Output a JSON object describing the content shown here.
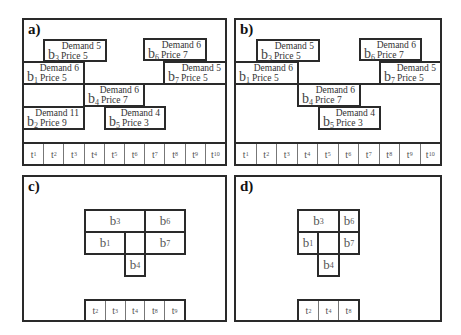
{
  "panels": {
    "a": {
      "label": "a)",
      "blocks": [
        {
          "id": "b3",
          "name": "b",
          "sub": "3",
          "demand": "Demand 5",
          "price": "Price 5"
        },
        {
          "id": "b6",
          "name": "b",
          "sub": "6",
          "demand": "Demand 6",
          "price": "Price 7"
        },
        {
          "id": "b1",
          "name": "b",
          "sub": "1",
          "demand": "Demand 6",
          "price": "Price 5"
        },
        {
          "id": "b7",
          "name": "b",
          "sub": "7",
          "demand": "Demand 5",
          "price": "Price 5"
        },
        {
          "id": "b4",
          "name": "b",
          "sub": "4",
          "demand": "Demand 6",
          "price": "Price 7"
        },
        {
          "id": "b2",
          "name": "b",
          "sub": "2",
          "demand": "Demand 11",
          "price": "Price 9"
        },
        {
          "id": "b5",
          "name": "b",
          "sub": "5",
          "demand": "Demand 4",
          "price": "Price 3"
        }
      ],
      "timeslots": [
        {
          "t": "t",
          "sub": "1"
        },
        {
          "t": "t",
          "sub": "2"
        },
        {
          "t": "t",
          "sub": "3"
        },
        {
          "t": "t",
          "sub": "4"
        },
        {
          "t": "t",
          "sub": "5"
        },
        {
          "t": "t",
          "sub": "6"
        },
        {
          "t": "t",
          "sub": "7"
        },
        {
          "t": "t",
          "sub": "8"
        },
        {
          "t": "t",
          "sub": "9"
        },
        {
          "t": "t",
          "sub": "10"
        }
      ]
    },
    "b": {
      "label": "b)",
      "blocks": [
        {
          "id": "b3",
          "name": "b",
          "sub": "3",
          "demand": "Demand 5",
          "price": "Price 5"
        },
        {
          "id": "b6",
          "name": "b",
          "sub": "6",
          "demand": "Demand 6",
          "price": "Price 7"
        },
        {
          "id": "b1",
          "name": "b",
          "sub": "1",
          "demand": "Demand 6",
          "price": "Price 5"
        },
        {
          "id": "b7",
          "name": "b",
          "sub": "7",
          "demand": "Demand 5",
          "price": "Price 5"
        },
        {
          "id": "b4",
          "name": "b",
          "sub": "4",
          "demand": "Demand 6",
          "price": "Price 7"
        },
        {
          "id": "b5",
          "name": "b",
          "sub": "5",
          "demand": "Demand 4",
          "price": "Price 3"
        }
      ],
      "timeslots": [
        {
          "t": "t",
          "sub": "1"
        },
        {
          "t": "t",
          "sub": "2"
        },
        {
          "t": "t",
          "sub": "3"
        },
        {
          "t": "t",
          "sub": "4"
        },
        {
          "t": "t",
          "sub": "5"
        },
        {
          "t": "t",
          "sub": "6"
        },
        {
          "t": "t",
          "sub": "7"
        },
        {
          "t": "t",
          "sub": "8"
        },
        {
          "t": "t",
          "sub": "9"
        },
        {
          "t": "t",
          "sub": "10"
        }
      ]
    },
    "c": {
      "label": "c)",
      "blocks": [
        {
          "id": "b3",
          "name": "b",
          "sub": "3"
        },
        {
          "id": "b6",
          "name": "b",
          "sub": "6"
        },
        {
          "id": "b1",
          "name": "b",
          "sub": "1"
        },
        {
          "id": "b7",
          "name": "b",
          "sub": "7"
        },
        {
          "id": "b4",
          "name": "b",
          "sub": "4"
        }
      ],
      "timeslots": [
        {
          "t": "t",
          "sub": "2"
        },
        {
          "t": "t",
          "sub": "3"
        },
        {
          "t": "t",
          "sub": "4"
        },
        {
          "t": "t",
          "sub": "8"
        },
        {
          "t": "t",
          "sub": "9"
        }
      ]
    },
    "d": {
      "label": "d)",
      "blocks": [
        {
          "id": "b3",
          "name": "b",
          "sub": "3"
        },
        {
          "id": "b6",
          "name": "b",
          "sub": "6"
        },
        {
          "id": "b1",
          "name": "b",
          "sub": "1"
        },
        {
          "id": "b7",
          "name": "b",
          "sub": "7"
        },
        {
          "id": "b4",
          "name": "b",
          "sub": "4"
        }
      ],
      "timeslots": [
        {
          "t": "t",
          "sub": "2"
        },
        {
          "t": "t",
          "sub": "4"
        },
        {
          "t": "t",
          "sub": "8"
        }
      ]
    }
  }
}
